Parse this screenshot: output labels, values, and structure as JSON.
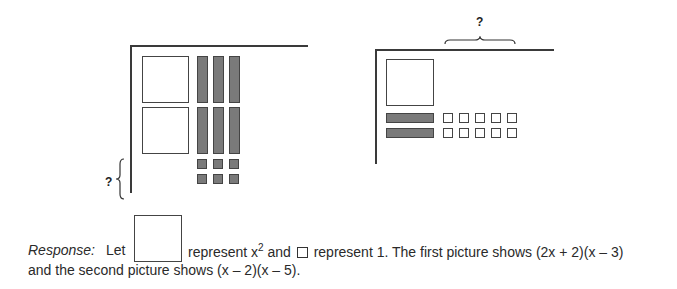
{
  "figure_left": {
    "question_mark": "?",
    "tiles": {
      "x_squared_count": 2,
      "neg_x_bars": 6,
      "neg_units": 6
    }
  },
  "figure_right": {
    "question_mark": "?",
    "tiles": {
      "x_squared_count": 1,
      "neg_x_bars": 2,
      "pos_units": 10
    }
  },
  "response": {
    "label": "Response:",
    "let": "Let",
    "represent_x2": "represent x",
    "exponent": "2",
    "and": "and",
    "represent_1": "represent 1.  The first picture shows (2x + 2)(x – 3)",
    "line2": "and the second picture shows (x – 2)(x – 5)."
  },
  "colors": {
    "tile_gray": "#7a7a7a",
    "line": "#3a3a3a"
  }
}
